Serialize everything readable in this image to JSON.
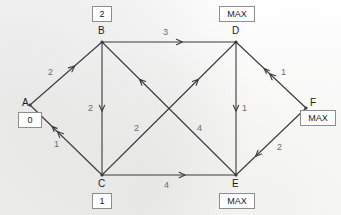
{
  "diagram": {
    "type": "directed-graph",
    "background_color": "#fdfdfc",
    "edge_color": "#3a3a3a",
    "label_color": "#6b6b6b",
    "box_border_color": "#8d8d8d"
  },
  "nodes": [
    {
      "id": "A",
      "label": "A",
      "value": "0",
      "x": 30,
      "y": 105,
      "letter_x": 22,
      "letter_y": 98,
      "box_x": 18,
      "box_y": 112,
      "box_w": 24,
      "box_h": 16
    },
    {
      "id": "B",
      "label": "B",
      "value": "2",
      "x": 102,
      "y": 42,
      "letter_x": 98,
      "letter_y": 26,
      "box_x": 92,
      "box_y": 6,
      "box_w": 20,
      "box_h": 16
    },
    {
      "id": "C",
      "label": "C",
      "value": "1",
      "x": 102,
      "y": 175,
      "letter_x": 98,
      "letter_y": 179,
      "box_x": 92,
      "box_y": 193,
      "box_w": 20,
      "box_h": 16
    },
    {
      "id": "D",
      "label": "D",
      "value": "MAX",
      "x": 236,
      "y": 42,
      "letter_x": 232,
      "letter_y": 26,
      "box_x": 219,
      "box_y": 6,
      "box_w": 36,
      "box_h": 16
    },
    {
      "id": "E",
      "label": "E",
      "value": "MAX",
      "x": 236,
      "y": 175,
      "letter_x": 232,
      "letter_y": 179,
      "box_x": 219,
      "box_y": 193,
      "box_w": 36,
      "box_h": 16
    },
    {
      "id": "F",
      "label": "F",
      "value": "MAX",
      "x": 306,
      "y": 108,
      "letter_x": 310,
      "letter_y": 98,
      "box_x": 300,
      "box_y": 110,
      "box_w": 36,
      "box_h": 16
    }
  ],
  "edges": [
    {
      "id": "A-B",
      "from": "A",
      "to": "B",
      "capacity": "2",
      "label_x": 48,
      "label_y": 68,
      "arrow_t": 0.62,
      "double_head": false
    },
    {
      "id": "C-A",
      "from": "C",
      "to": "A",
      "capacity": "1",
      "label_x": 54,
      "label_y": 140,
      "arrow_t": 0.62,
      "double_head": true
    },
    {
      "id": "B-D",
      "from": "B",
      "to": "D",
      "capacity": "3",
      "label_x": 163,
      "label_y": 28,
      "arrow_t": 0.6,
      "double_head": false
    },
    {
      "id": "B-C",
      "from": "B",
      "to": "C",
      "capacity": "2",
      "label_x": 88,
      "label_y": 104,
      "arrow_t": 0.52,
      "double_head": false
    },
    {
      "id": "D-E",
      "from": "D",
      "to": "E",
      "capacity": "1",
      "label_x": 242,
      "label_y": 104,
      "arrow_t": 0.52,
      "double_head": false
    },
    {
      "id": "C-E",
      "from": "C",
      "to": "E",
      "capacity": "4",
      "label_x": 164,
      "label_y": 181,
      "arrow_t": 0.62,
      "double_head": false
    },
    {
      "id": "E-B",
      "from": "E",
      "to": "B",
      "capacity": "2",
      "label_x": 134,
      "label_y": 124,
      "arrow_t": 0.72,
      "double_head": false
    },
    {
      "id": "C-D",
      "from": "C",
      "to": "D",
      "capacity": "4",
      "label_x": 197,
      "label_y": 124,
      "arrow_t": 0.72,
      "double_head": false
    },
    {
      "id": "F-D",
      "from": "F",
      "to": "D",
      "capacity": "1",
      "label_x": 281,
      "label_y": 68,
      "arrow_t": 0.52,
      "double_head": true
    },
    {
      "id": "F-E",
      "from": "F",
      "to": "E",
      "capacity": "2",
      "label_x": 277,
      "label_y": 143,
      "arrow_t": 0.72,
      "double_head": false
    }
  ]
}
